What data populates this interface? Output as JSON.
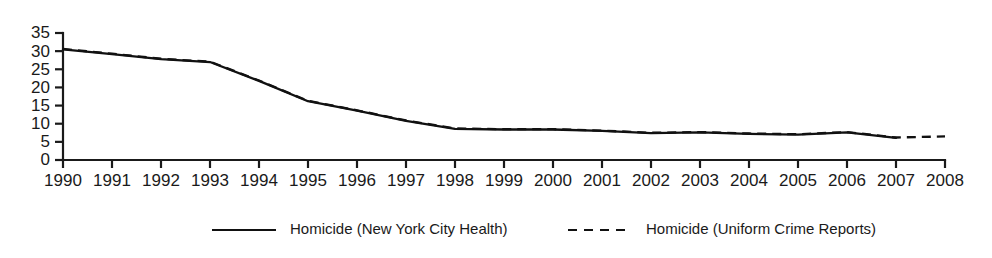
{
  "chart_data": {
    "type": "line",
    "title": "",
    "subtitle": "",
    "xlabel": "",
    "ylabel": "",
    "xlim": [
      1990,
      2008
    ],
    "ylim": [
      0,
      35
    ],
    "grid": false,
    "legend_position": "bottom",
    "x": [
      1990,
      1991,
      1992,
      1993,
      1994,
      1995,
      1996,
      1997,
      1998,
      1999,
      2000,
      2001,
      2002,
      2003,
      2004,
      2005,
      2006,
      2007,
      2008
    ],
    "y_ticks": [
      0,
      5,
      10,
      15,
      20,
      25,
      30,
      35
    ],
    "x_ticks": [
      "1990",
      "1991",
      "1992",
      "1993",
      "1994",
      "1995",
      "1996",
      "1997",
      "1998",
      "1999",
      "2000",
      "2001",
      "2002",
      "2003",
      "2004",
      "2005",
      "2006",
      "2007",
      "2008"
    ],
    "series": [
      {
        "name": "Homicide (New York City Health)",
        "style": "solid",
        "color": "#111111",
        "x": [
          1990,
          1991,
          1992,
          1993,
          1994,
          1995,
          1996,
          1997,
          1998,
          1999,
          2000,
          2001,
          2002,
          2003,
          2004,
          2005,
          2006,
          2007
        ],
        "values": [
          30.5,
          29.2,
          27.8,
          27.0,
          21.8,
          16.2,
          13.6,
          10.8,
          8.6,
          8.4,
          8.4,
          8.0,
          7.4,
          7.6,
          7.2,
          7.0,
          7.6,
          6.1
        ]
      },
      {
        "name": "Homicide (Uniform Crime Reports)",
        "style": "dashed",
        "color": "#111111",
        "x": [
          1990,
          1991,
          1992,
          1993,
          1994,
          1995,
          1996,
          1997,
          1998,
          1999,
          2000,
          2001,
          2002,
          2003,
          2004,
          2005,
          2006,
          2007,
          2008
        ],
        "values": [
          30.6,
          29.3,
          27.9,
          27.1,
          21.9,
          16.3,
          13.7,
          10.9,
          8.7,
          8.5,
          8.5,
          8.1,
          7.5,
          7.7,
          7.3,
          7.1,
          7.7,
          6.2,
          6.5
        ]
      }
    ]
  },
  "legend": {
    "entries": [
      {
        "label": "Homicide (New York City Health)",
        "style": "solid"
      },
      {
        "label": "Homicide (Uniform Crime Reports)",
        "style": "dashed"
      }
    ]
  }
}
